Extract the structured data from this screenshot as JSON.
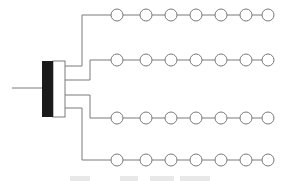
{
  "diagram": {
    "type": "manifold-distribution",
    "colors": {
      "line": "#7a7a7a",
      "block_fill": "#1a1a1a",
      "manifold_fill": "#ffffff",
      "node_stroke": "#7a7a7a",
      "node_fill": "#ffffff"
    },
    "input_line": {
      "x1": 12,
      "x2": 42,
      "y": 88
    },
    "source_block": {
      "x": 42,
      "y": 61,
      "width": 11,
      "height": 56
    },
    "manifold_box": {
      "x": 53,
      "y": 61,
      "width": 12,
      "height": 56
    },
    "branches": [
      {
        "exit_y": 66,
        "turn_x": 82,
        "row_y": 15
      },
      {
        "exit_y": 80,
        "turn_x": 90,
        "row_y": 60
      },
      {
        "exit_y": 95,
        "turn_x": 90,
        "row_y": 118
      },
      {
        "exit_y": 108,
        "turn_x": 82,
        "row_y": 160
      }
    ],
    "node_radius": 6,
    "node_x": [
      117,
      146,
      171,
      196,
      221,
      246,
      268
    ],
    "nodes_per_row": 7,
    "row_count": 4
  },
  "caption": {
    "visible": "clipped",
    "text": ""
  }
}
